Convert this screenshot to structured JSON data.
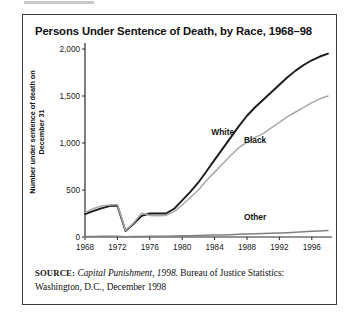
{
  "figure": {
    "title": "Persons Under Sentence of Death, by Race, 1968–98",
    "source_prefix": "SOURCE:",
    "source_italic": "Capital Punishment, 1998.",
    "source_rest": "Bureau of Justice Statistics: Washington, D.C., December 1998"
  },
  "chart_data": {
    "type": "line",
    "title": "Persons Under Sentence of Death, by Race, 1968–98",
    "xlabel": "",
    "ylabel": "Number under sentence of death on December 31",
    "xlim": [
      1968,
      1998
    ],
    "ylim": [
      0,
      2000
    ],
    "yticks": [
      0,
      500,
      1000,
      1500,
      2000
    ],
    "ytick_labels": [
      "0",
      "500",
      "1,000",
      "1,500",
      "2,000"
    ],
    "xticks": [
      1968,
      1972,
      1976,
      1980,
      1984,
      1988,
      1992,
      1996
    ],
    "xtick_labels": [
      "1968",
      "1972",
      "1976",
      "1980",
      "1984",
      "1988",
      "1992",
      "1996"
    ],
    "grid": false,
    "legend": "inline-annotations",
    "x": [
      1968,
      1969,
      1970,
      1971,
      1972,
      1973,
      1974,
      1975,
      1976,
      1977,
      1978,
      1979,
      1980,
      1981,
      1982,
      1983,
      1984,
      1985,
      1986,
      1987,
      1988,
      1989,
      1990,
      1991,
      1992,
      1993,
      1994,
      1995,
      1996,
      1997,
      1998
    ],
    "series": [
      {
        "name": "White",
        "color": "#1a1a1a",
        "label_x": 1985,
        "label_y": 1080,
        "values": [
          243,
          275,
          305,
          328,
          334,
          64,
          140,
          225,
          250,
          250,
          250,
          300,
          390,
          480,
          580,
          700,
          820,
          940,
          1060,
          1180,
          1290,
          1380,
          1460,
          1540,
          1620,
          1700,
          1770,
          1830,
          1880,
          1920,
          1950
        ]
      },
      {
        "name": "Black",
        "color": "#a8a8a8",
        "label_x": 1989,
        "label_y": 1000,
        "values": [
          260,
          300,
          330,
          340,
          345,
          70,
          150,
          255,
          230,
          225,
          230,
          270,
          340,
          420,
          500,
          600,
          690,
          780,
          870,
          950,
          1010,
          1060,
          1100,
          1160,
          1220,
          1280,
          1330,
          1380,
          1430,
          1470,
          1500
        ]
      },
      {
        "name": "Other",
        "color": "#808080",
        "label_x": 1989,
        "label_y": 185,
        "values": [
          5,
          6,
          7,
          8,
          8,
          2,
          4,
          6,
          8,
          8,
          9,
          10,
          12,
          14,
          16,
          18,
          20,
          22,
          25,
          28,
          31,
          34,
          37,
          40,
          43,
          46,
          50,
          55,
          60,
          65,
          70
        ]
      }
    ]
  }
}
